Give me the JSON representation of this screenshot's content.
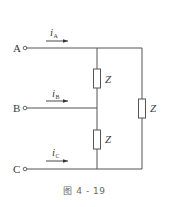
{
  "diagram": {
    "type": "three-phase delta circuit",
    "terminals": [
      {
        "label": "A",
        "current": {
          "symbol": "i",
          "subscript": "A"
        }
      },
      {
        "label": "B",
        "current": {
          "symbol": "i",
          "subscript": "B"
        }
      },
      {
        "label": "C",
        "current": {
          "symbol": "i",
          "subscript": "C"
        }
      }
    ],
    "impedances": [
      {
        "label": "Z",
        "between": "A-B"
      },
      {
        "label": "Z",
        "between": "B-C"
      },
      {
        "label": "Z",
        "between": "A-C"
      }
    ],
    "caption": "图 4 - 19",
    "colors": {
      "line": "#555555",
      "text": "#3a3a3a",
      "caption": "#6a6a6a"
    }
  }
}
